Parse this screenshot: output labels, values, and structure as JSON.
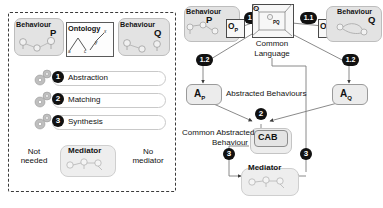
{
  "diagram": {
    "colors": {
      "accent_dark": "#111111",
      "panel_fill": "#e3e3e3",
      "line": "#4a4a4a",
      "dashed_border": "#3b3b3b"
    }
  },
  "left_panel": {
    "name": "overview-process-panel",
    "behaviour_p": {
      "title": "Behaviour",
      "letter": "P"
    },
    "behaviour_q": {
      "title": "Behaviour",
      "letter": "Q"
    },
    "ontology": {
      "title": "Ontology",
      "nodes": [
        "a",
        "c",
        "y",
        "x"
      ]
    },
    "steps": [
      {
        "number": "1",
        "label": "Abstraction"
      },
      {
        "number": "2",
        "label": "Matching"
      },
      {
        "number": "3",
        "label": "Synthesis"
      }
    ],
    "outcomes": [
      {
        "name": "not-needed",
        "line1": "Not",
        "line2": "needed"
      },
      {
        "name": "mediator",
        "line1": "Mediator",
        "line2": ""
      },
      {
        "name": "no-mediator",
        "line1": "No",
        "line2": "mediator"
      }
    ]
  },
  "right_panel": {
    "name": "detailed-process-panel",
    "behaviour_p": {
      "title": "Behaviour",
      "letter": "P"
    },
    "behaviour_q": {
      "title": "Behaviour",
      "letter": "Q"
    },
    "ontology_p": {
      "label": "O",
      "sub": "P"
    },
    "ontology_q": {
      "label": "O",
      "sub": "Q"
    },
    "common_ontology": {
      "label": "O",
      "inner_label": "O",
      "inner_sub": "PQ"
    },
    "common_language": {
      "line1": "Common",
      "line2": "Language"
    },
    "markers": {
      "one_one_left": "1.1",
      "one_one_right": "1.1",
      "one_two_left": "1.2",
      "one_two_right": "1.2",
      "two": "2",
      "three_left": "3",
      "three_right": "3"
    },
    "abstracted_p": {
      "label": "A",
      "sub": "P"
    },
    "abstracted_q": {
      "label": "A",
      "sub": "Q"
    },
    "abstracted_behaviours_label": "Abstracted Behaviours",
    "common_abstracted": {
      "caption_line1": "Common Abstracted",
      "caption_line2": "Behaviour",
      "box_label": "CAB"
    },
    "mediator": {
      "label": "Mediator"
    }
  }
}
